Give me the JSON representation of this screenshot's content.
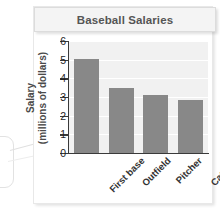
{
  "chart_data": {
    "type": "bar",
    "title": "Baseball Salaries",
    "xlabel": "",
    "ylabel": "Salary (millions of dollars)",
    "ylabel_line1": "Salary",
    "ylabel_line2": "(millions of dollars)",
    "categories": [
      "First base",
      "Outfield",
      "Pitcher",
      "Catcher"
    ],
    "values": [
      5.05,
      3.5,
      3.1,
      2.85
    ],
    "ylim": [
      0,
      6
    ],
    "yticks": [
      0,
      1,
      2,
      3,
      4,
      5,
      6
    ],
    "ytick_labels": [
      "0",
      "1",
      "2",
      "3",
      "4",
      "5",
      "6"
    ],
    "grid": true,
    "legend": false,
    "bar_color": "#888888",
    "plot_background": "#f1f1f1",
    "gridline_color": "#ffffff",
    "axis_color": "#3a3a3a",
    "title_color": "#555555"
  },
  "callout": {
    "label": ""
  }
}
